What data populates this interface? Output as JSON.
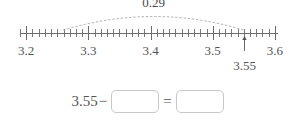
{
  "colors": {
    "axis": "#6b6b6b",
    "text": "#555555",
    "arc": "#b0b0b0",
    "box_border": "#c8c8c8",
    "background": "#ffffff"
  },
  "number_line": {
    "name": "number-line",
    "axis_min": 3.19,
    "axis_max": 3.605,
    "major_step": 0.1,
    "minor_step": 0.01,
    "major_tick_labels": [
      "3.2",
      "3.3",
      "3.4",
      "3.5",
      "3.6"
    ],
    "major_tick_values": [
      3.2,
      3.3,
      3.4,
      3.5,
      3.6
    ],
    "span_arc": {
      "start_value": 3.26,
      "end_value": 3.55,
      "label": "0.29"
    },
    "pointer": {
      "value": 3.55,
      "label": "3.55"
    }
  },
  "equation": {
    "name": "subtraction-equation",
    "left_term": "3.55",
    "minus_sign": "−",
    "equals_sign": "=",
    "blank1_value": "",
    "blank1_placeholder": "",
    "blank2_value": "",
    "blank2_placeholder": ""
  },
  "chart_data": {
    "type": "number-line",
    "title": "",
    "xlabel": "",
    "ylabel": "",
    "xlim": [
      3.19,
      3.605
    ],
    "grid": false,
    "legend": "none",
    "tick_labels": [
      "3.2",
      "3.3",
      "3.4",
      "3.5",
      "3.6"
    ],
    "tick_values": [
      3.2,
      3.3,
      3.4,
      3.5,
      3.6
    ],
    "minor_tick_step": 0.01,
    "annotations": [
      {
        "type": "arc-span",
        "from": 3.26,
        "to": 3.55,
        "label": "0.29"
      },
      {
        "type": "arrow-marker",
        "at": 3.55,
        "label": "3.55"
      }
    ]
  }
}
